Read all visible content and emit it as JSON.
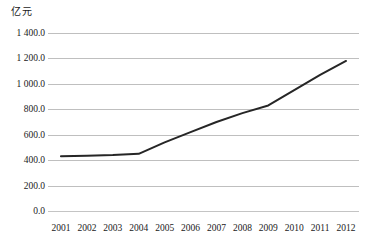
{
  "chart_data": {
    "type": "line",
    "title": "",
    "subtitle": "",
    "xlabel": "",
    "ylabel": "亿元",
    "y_unit_label": "亿元",
    "categories": [
      "2001",
      "2002",
      "2003",
      "2004",
      "2005",
      "2006",
      "2007",
      "2008",
      "2009",
      "2010",
      "2011",
      "2012"
    ],
    "series": [
      {
        "name": "",
        "values": [
          430,
          435,
          440,
          450,
          540,
          620,
          700,
          770,
          830,
          950,
          1070,
          1180
        ],
        "color": "#262626"
      }
    ],
    "ylim": [
      0,
      1400
    ],
    "ytick_values": [
      0,
      200,
      400,
      600,
      800,
      1000,
      1200,
      1400
    ],
    "ytick_labels": [
      "0.0",
      "200.0",
      "400.0",
      "600.0",
      "800.0",
      "1 000.0",
      "1 200.0",
      "1 400.0"
    ],
    "grid": true,
    "grid_color": "#bfbfbf",
    "legend": "none",
    "legend_position": "none",
    "annotations": []
  }
}
